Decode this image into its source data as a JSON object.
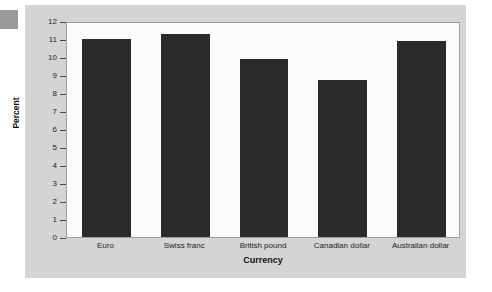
{
  "chart_data": {
    "type": "bar",
    "title": "",
    "xlabel": "Currency",
    "ylabel": "Percent",
    "categories": [
      "Euro",
      "Swiss franc",
      "British pound",
      "Canadian dollar",
      "Australian dollar"
    ],
    "values": [
      11.0,
      11.3,
      9.9,
      8.7,
      10.9
    ],
    "ylim": [
      0,
      12
    ],
    "ytick_labels": [
      "12",
      "11",
      "10",
      "9",
      "8",
      "7",
      "6",
      "5",
      "4",
      "3",
      "2",
      "1",
      "0"
    ],
    "ytick_values": [
      12,
      11,
      10,
      9,
      8,
      7,
      6,
      5,
      4,
      3,
      2,
      1,
      0
    ],
    "grid": false,
    "legend": false,
    "bar_color": "#2b2b2b",
    "plot_background": "#fcfcfc",
    "panel_background": "#d4d4d4",
    "axis_color": "#4a4a4a"
  }
}
